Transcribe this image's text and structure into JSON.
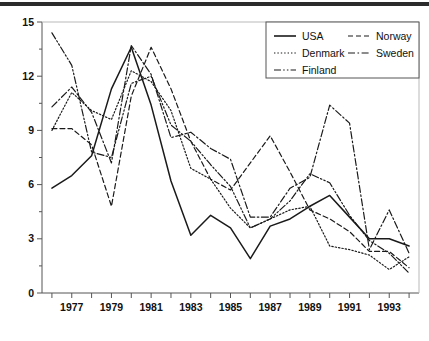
{
  "figure": {
    "background": "#ffffff",
    "axis_color": "#555555",
    "text_color": "#111111",
    "top_rule_color": "#2b2b2b"
  },
  "legend": {
    "position": "top-right",
    "entries": [
      {
        "label": "USA",
        "dash": "solid",
        "sample": "line-sample-usa"
      },
      {
        "label": "Norway",
        "dash": "dashed",
        "sample": "line-sample-norway"
      },
      {
        "label": "Denmark",
        "dash": "dotted",
        "sample": "line-sample-denmark"
      },
      {
        "label": "Sweden",
        "dash": "dash-dot",
        "sample": "line-sample-sweden"
      },
      {
        "label": "Finland",
        "dash": "dash-dot-dot",
        "sample": "line-sample-finland"
      }
    ]
  },
  "chart_data": {
    "type": "line",
    "title": "",
    "subtitle": "",
    "xlabel": "",
    "ylabel": "",
    "xlim": [
      1975.5,
      1994.5
    ],
    "ylim": [
      0,
      15
    ],
    "grid": false,
    "legend_position": "top-right",
    "x": [
      1976,
      1977,
      1978,
      1979,
      1980,
      1981,
      1982,
      1983,
      1984,
      1985,
      1986,
      1987,
      1988,
      1989,
      1990,
      1991,
      1992,
      1993,
      1994
    ],
    "y_ticks": [
      0,
      3,
      6,
      9,
      12,
      15
    ],
    "y_tick_labels": [
      "0",
      "3",
      "6",
      "9",
      "12",
      "15"
    ],
    "y_minor_step": 1.5,
    "x_ticks": [
      1976,
      1977,
      1978,
      1979,
      1980,
      1981,
      1982,
      1983,
      1984,
      1985,
      1986,
      1987,
      1988,
      1989,
      1990,
      1991,
      1992,
      1993,
      1994
    ],
    "x_tick_labels_shown": [
      "1977",
      "1979",
      "1981",
      "1983",
      "1985",
      "1987",
      "1989",
      "1991",
      "1993"
    ],
    "series": [
      {
        "name": "USA",
        "dash": "solid",
        "values": [
          5.8,
          6.5,
          7.6,
          11.3,
          13.6,
          10.4,
          6.2,
          3.2,
          4.3,
          3.6,
          1.9,
          3.7,
          4.1,
          4.8,
          5.4,
          4.2,
          3.0,
          3.0,
          2.6
        ]
      },
      {
        "name": "Norway",
        "dash": "dashed",
        "values": [
          9.1,
          9.1,
          8.2,
          4.8,
          10.9,
          13.6,
          11.3,
          8.4,
          6.3,
          5.7,
          7.2,
          8.7,
          6.7,
          4.6,
          4.1,
          3.4,
          2.3,
          2.3,
          1.4
        ]
      },
      {
        "name": "Denmark",
        "dash": "dotted",
        "values": [
          9.0,
          11.1,
          10.1,
          9.6,
          12.3,
          11.7,
          10.1,
          6.9,
          6.3,
          4.7,
          3.6,
          4.1,
          4.6,
          4.8,
          2.6,
          2.4,
          2.1,
          1.3,
          2.0
        ]
      },
      {
        "name": "Sweden",
        "dash": "dash-dot",
        "values": [
          10.3,
          11.4,
          10.0,
          7.2,
          13.7,
          12.1,
          8.6,
          8.9,
          8.0,
          7.4,
          4.2,
          4.2,
          5.8,
          6.4,
          10.4,
          9.4,
          2.4,
          4.6,
          2.2
        ]
      },
      {
        "name": "Finland",
        "dash": "dash-dot-dot",
        "values": [
          14.4,
          12.6,
          7.8,
          7.5,
          11.6,
          12.0,
          9.3,
          8.4,
          7.1,
          5.9,
          3.6,
          4.1,
          5.1,
          6.6,
          6.1,
          4.3,
          2.9,
          2.2,
          1.1
        ]
      }
    ]
  }
}
